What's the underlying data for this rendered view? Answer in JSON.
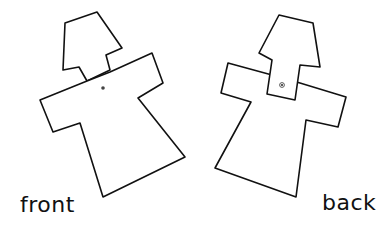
{
  "diagram": {
    "figures": [
      {
        "id": "front",
        "label": "front"
      },
      {
        "id": "back",
        "label": "back"
      }
    ],
    "colors": {
      "stroke": "#111111",
      "background": "#ffffff"
    }
  }
}
